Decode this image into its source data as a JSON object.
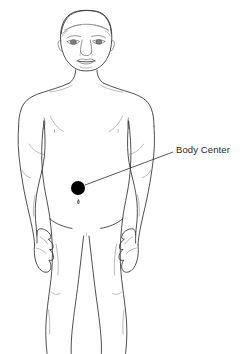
{
  "diagram": {
    "title": "Body Center",
    "background_color": "#ffffff",
    "outline_color": "#3c3c3c",
    "marker_color": "#000000",
    "label_color": "#262626",
    "annotations": [
      {
        "id": "body-center",
        "label": "Body Center",
        "marker_type": "filled-circle",
        "marker_color": "#000000",
        "marker_x": 78,
        "marker_y": 188,
        "marker_radius": 7,
        "leader_from_x": 85,
        "leader_from_y": 185,
        "leader_to_x": 173,
        "leader_to_y": 152,
        "label_x": 176,
        "label_y": 144
      }
    ],
    "figure_parts": [
      "head",
      "hair",
      "eyebrows",
      "eyes",
      "nose",
      "mouth",
      "neck",
      "shoulders",
      "torso",
      "navel",
      "left-arm",
      "right-arm",
      "left-hand",
      "right-hand",
      "hips",
      "left-leg",
      "right-leg"
    ]
  }
}
